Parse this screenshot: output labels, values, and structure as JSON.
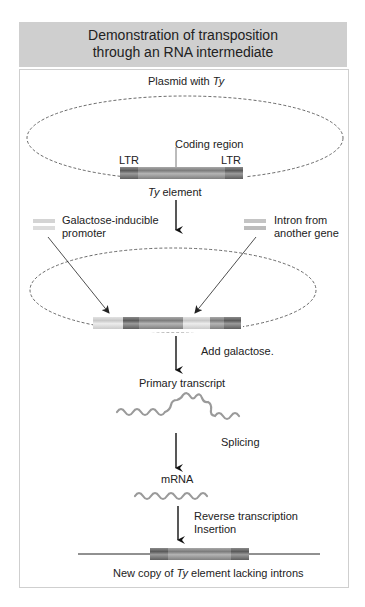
{
  "title": {
    "line1": "Demonstration of transposition",
    "line2": "through an RNA intermediate"
  },
  "labels": {
    "plasmid_prefix": "Plasmid with ",
    "plasmid_ty": "Ty",
    "coding_region": "Coding region",
    "ltr_left": "LTR",
    "ltr_right": "LTR",
    "ty_element_ty": "Ty",
    "ty_element_suffix": " element",
    "gal_promoter_line1": "Galactose-inducible",
    "gal_promoter_line2": "promoter",
    "intron_line1": "Intron from",
    "intron_line2": "another gene",
    "add_galactose": "Add galactose.",
    "primary_transcript": "Primary transcript",
    "splicing": "Splicing",
    "mrna": "mRNA",
    "reverse_transcription": "Reverse transcription",
    "insertion": "Insertion",
    "new_copy_prefix": "New copy of ",
    "new_copy_ty": "Ty",
    "new_copy_suffix": " element lacking introns"
  },
  "colors": {
    "header_bg": "#cfcfcf",
    "panel_border": "#cfcfcf",
    "ltr_dark": "#6e6e6e",
    "coding_mid": "#9a9a9a",
    "promoter_light": "#d8d8d8",
    "intron_light": "#cccccc",
    "rna_wave": "#9a9a9a"
  }
}
